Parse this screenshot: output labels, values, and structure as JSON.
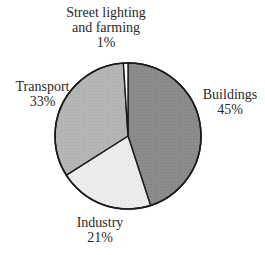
{
  "chart_data": {
    "type": "pie",
    "title": "",
    "start_angle_deg": 0,
    "direction": "clockwise",
    "categories": [
      "Buildings",
      "Industry",
      "Transport",
      "Street lighting and farming"
    ],
    "values": [
      45,
      21,
      33,
      1
    ],
    "unit": "%",
    "colors": [
      "#8c8c8c",
      "#ececec",
      "#b5b5b5",
      "#ffffff"
    ],
    "legend": "none",
    "labels": [
      {
        "name": "Buildings",
        "lines": [
          "Buildings"
        ],
        "pct": "45%"
      },
      {
        "name": "Industry",
        "lines": [
          "Industry"
        ],
        "pct": "21%"
      },
      {
        "name": "Transport",
        "lines": [
          "Transport"
        ],
        "pct": "33%"
      },
      {
        "name": "Street lighting and farming",
        "lines": [
          "Street lighting",
          "and farming"
        ],
        "pct": "1%"
      }
    ]
  },
  "labels": {
    "buildings": {
      "line1": "Buildings",
      "pct": "45%"
    },
    "industry": {
      "line1": "Industry",
      "pct": "21%"
    },
    "transport": {
      "line1": "Transport",
      "pct": "33%"
    },
    "street": {
      "line1": "Street lighting",
      "line2": "and farming",
      "pct": "1%"
    }
  }
}
